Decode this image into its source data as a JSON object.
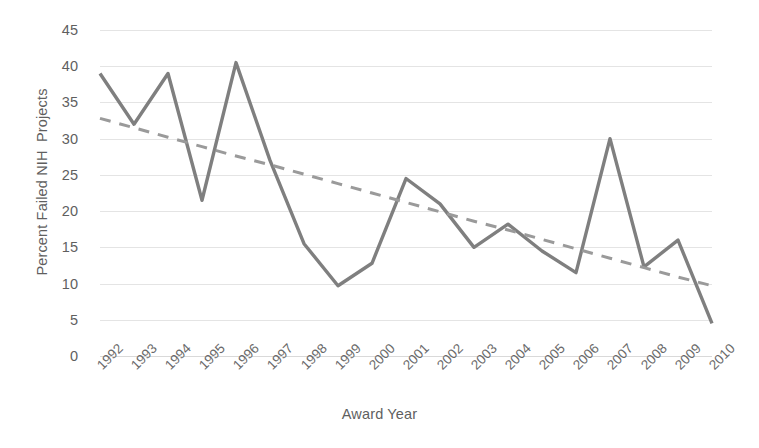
{
  "chart_data": {
    "type": "line",
    "title": "",
    "xlabel": "Award Year",
    "ylabel": "Percent Failed NIH  Projects",
    "categories": [
      "1992",
      "1993",
      "1994",
      "1995",
      "1996",
      "1997",
      "1998",
      "1999",
      "2000",
      "2001",
      "2002",
      "2003",
      "2004",
      "2005",
      "2006",
      "2007",
      "2008",
      "2009",
      "2010"
    ],
    "series": [
      {
        "name": "Percent Failed NIH Projects",
        "type": "line",
        "color": "#7f7f7f",
        "style": "solid",
        "values": [
          39.0,
          32.0,
          39.0,
          21.5,
          40.5,
          27.0,
          15.5,
          9.7,
          12.8,
          24.5,
          21.0,
          15.0,
          18.2,
          14.5,
          11.5,
          30.0,
          12.3,
          16.0,
          4.5
        ]
      },
      {
        "name": "Linear trendline",
        "type": "line",
        "color": "#9a9a9a",
        "style": "dashed",
        "values": [
          32.8,
          31.5,
          30.2,
          28.9,
          27.6,
          26.4,
          25.1,
          23.8,
          22.5,
          21.2,
          19.9,
          18.6,
          17.4,
          16.1,
          14.8,
          13.5,
          12.2,
          10.9,
          9.7
        ]
      }
    ],
    "ylim": [
      0,
      45
    ],
    "ytick_values": [
      0,
      5,
      10,
      15,
      20,
      25,
      30,
      35,
      40,
      45
    ],
    "ytick_labels": [
      "0",
      "5",
      "10",
      "15",
      "20",
      "25",
      "30",
      "35",
      "40",
      "45"
    ],
    "grid": true,
    "grid_axis": "y",
    "legend": false,
    "legend_position": "none",
    "xtick_rotation": -45,
    "colors": {
      "series_line": "#7f7f7f",
      "trendline": "#9a9a9a",
      "gridline": "#e4e4e4",
      "axis_text": "#5f5f5f",
      "tick_text": "#6a6a6a",
      "background": "#ffffff"
    }
  }
}
